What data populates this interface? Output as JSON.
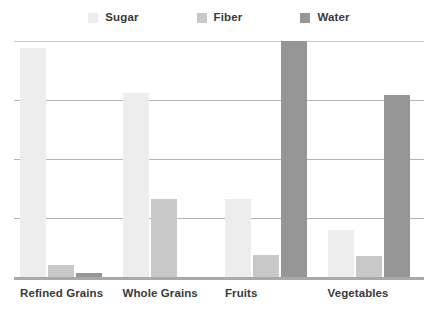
{
  "legend": {
    "position": "top-center",
    "items": [
      {
        "label": "Sugar",
        "color": "#ededed",
        "icon": "legend-swatch-icon"
      },
      {
        "label": "Fiber",
        "color": "#c8c8c8",
        "icon": "legend-swatch-icon"
      },
      {
        "label": "Water",
        "color": "#969696",
        "icon": "legend-swatch-icon"
      }
    ]
  },
  "axis": {
    "gridline_count": 4,
    "grid_color": "#b4b4b4",
    "axis_color": "#a9a9a9"
  },
  "chart_data": {
    "type": "bar",
    "title": "",
    "subtitle": "",
    "xlabel": "",
    "ylabel": "",
    "categories": [
      "Refined Grains",
      "Whole Grains",
      "Fruits",
      "Vegetables"
    ],
    "series": [
      {
        "name": "Sugar",
        "color": "#ededed",
        "values": [
          97,
          78,
          33,
          20
        ]
      },
      {
        "name": "Fiber",
        "color": "#c8c8c8",
        "values": [
          5,
          33,
          9.5,
          9
        ]
      },
      {
        "name": "Water",
        "color": "#969696",
        "values": [
          1.5,
          0,
          100,
          77
        ]
      }
    ],
    "ylim": [
      0,
      100
    ],
    "ytick_values": [
      0,
      25,
      50,
      75,
      100
    ],
    "ytick_labels": [
      "",
      "",
      "",
      "",
      ""
    ],
    "grid": true,
    "grid_axis": "y",
    "legend_position": "top-center",
    "bar_orientation": "vertical",
    "grouped": true
  }
}
